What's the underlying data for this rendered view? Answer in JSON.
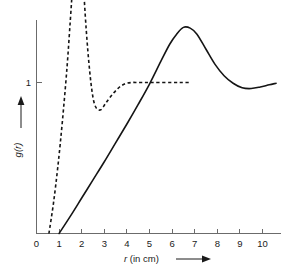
{
  "figure": {
    "background_color": "#ffffff",
    "width": 299,
    "height": 273
  },
  "axes": {
    "x_label": "r (in cm)",
    "y_label": "g(r)",
    "x_label_italic_part": "r",
    "x_label_rest": " (in cm)",
    "y_ticks": [
      "1"
    ],
    "x_ticks": [
      "0",
      "1",
      "2",
      "3",
      "4",
      "5",
      "6",
      "7",
      "8",
      "9",
      "10"
    ],
    "x_arrow": "right-arrow",
    "y_arrow": "up-arrow",
    "axis_color": "#6b6b6b",
    "text_color": "#1a1a1a"
  },
  "chart_data": {
    "type": "line",
    "title": "",
    "subtitle": "",
    "xlabel": "r (in cm)",
    "ylabel": "g(r)",
    "xlim": [
      0,
      10.8
    ],
    "ylim": [
      0,
      2.05
    ],
    "grid": false,
    "legend_position": "none",
    "x_tick_values": [
      0,
      1,
      2,
      3,
      4,
      5,
      6,
      7,
      8,
      9,
      10
    ],
    "y_tick_values": [
      1
    ],
    "series": [
      {
        "name": "dashed-curve",
        "style": "dashed",
        "color": "#151515",
        "description": "Sharp first peak radial distribution function, rapidly damped to unity",
        "x": [
          0.55,
          0.75,
          0.95,
          1.15,
          1.35,
          1.5,
          1.62,
          1.75,
          1.85,
          1.95,
          2.05,
          2.2,
          2.35,
          2.5,
          2.65,
          2.85,
          3.05,
          3.3,
          3.6,
          3.9,
          4.2,
          4.5,
          4.8,
          5.1,
          5.5,
          6.0,
          6.4,
          6.8
        ],
        "y": [
          0.0,
          0.2,
          0.45,
          0.75,
          1.1,
          1.42,
          1.68,
          1.87,
          1.93,
          1.88,
          1.7,
          1.35,
          1.08,
          0.9,
          0.83,
          0.82,
          0.86,
          0.91,
          0.96,
          0.99,
          1.0,
          1.0,
          1.0,
          1.0,
          1.0,
          1.0,
          1.0,
          1.0
        ]
      },
      {
        "name": "solid-curve",
        "style": "solid",
        "color": "#151515",
        "description": "Slowly rising broad-peaked radial distribution function approaching unity",
        "x": [
          1.0,
          1.5,
          2.0,
          2.5,
          3.0,
          3.5,
          4.0,
          4.5,
          5.0,
          5.5,
          5.9,
          6.2,
          6.5,
          6.8,
          7.1,
          7.5,
          7.9,
          8.3,
          8.7,
          9.1,
          9.5,
          9.9,
          10.3,
          10.6
        ],
        "y": [
          0.0,
          0.115,
          0.235,
          0.355,
          0.475,
          0.6,
          0.725,
          0.855,
          0.99,
          1.14,
          1.255,
          1.32,
          1.365,
          1.36,
          1.32,
          1.22,
          1.12,
          1.045,
          0.995,
          0.965,
          0.96,
          0.97,
          0.985,
          0.995
        ]
      }
    ],
    "annotations": [
      {
        "name": "reference-level",
        "text": "1",
        "y_value": 1,
        "axis": "y"
      }
    ]
  }
}
